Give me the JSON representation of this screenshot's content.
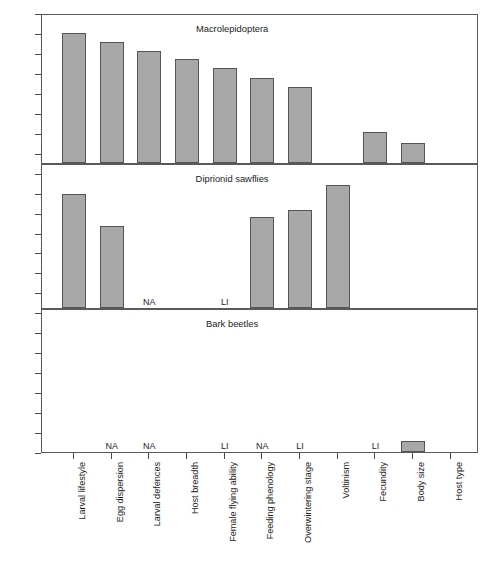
{
  "chart_data": {
    "type": "bar",
    "title": "",
    "xlabel": "",
    "ylabel": "Relative importance of trait in predicting population dynamics",
    "ylim": [
      0,
      1
    ],
    "grid": false,
    "legend": "none",
    "axis": {
      "y_tick_count": 22,
      "y_tick_labels": [],
      "x_tick_count": 11
    },
    "categories": [
      "Larval lifestyle",
      "Egg dispersion",
      "Larval defences",
      "Host breadth",
      "Female flying ability",
      "Feeding phenology",
      "Overwintering stage",
      "Voltinism",
      "Fecundity",
      "Body size",
      "Host type"
    ],
    "panels": [
      {
        "name": "Macrolepidoptera",
        "label": "Macrolepidoptera",
        "label_x_frac": 0.435,
        "values": [
          0.88,
          0.82,
          0.755,
          0.7,
          0.645,
          0.575,
          0.515,
          0.0,
          0.21,
          0.135,
          0.0
        ],
        "annotations": []
      },
      {
        "name": "Diprionid sawflies",
        "label": "Diprionid sawflies",
        "label_x_frac": 0.435,
        "values": [
          0.795,
          0.575,
          0.0,
          0.0,
          0.0,
          0.635,
          0.685,
          0.86,
          0.0,
          0.0,
          0.0
        ],
        "annotations": [
          {
            "category_index": 2,
            "text": "NA"
          },
          {
            "category_index": 4,
            "text": "LI"
          }
        ]
      },
      {
        "name": "Bark beetles",
        "label": "Bark beetles",
        "label_x_frac": 0.435,
        "values": [
          0.0,
          0.0,
          0.0,
          0.0,
          0.0,
          0.0,
          0.0,
          0.0,
          0.0,
          0.075,
          0.0
        ],
        "annotations": [
          {
            "category_index": 1,
            "text": "NA"
          },
          {
            "category_index": 2,
            "text": "NA"
          },
          {
            "category_index": 4,
            "text": "LI"
          },
          {
            "category_index": 5,
            "text": "NA"
          },
          {
            "category_index": 6,
            "text": "LI"
          },
          {
            "category_index": 8,
            "text": "LI"
          }
        ]
      }
    ],
    "colors": {
      "bar_fill": "#a8a8a8",
      "bar_stroke": "#555555",
      "axis": "#4a4a4a",
      "frame": "#5a5a5a",
      "text": "#1c1c1c",
      "background": "#ffffff"
    }
  }
}
